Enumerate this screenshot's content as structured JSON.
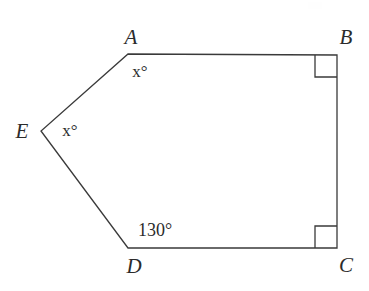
{
  "figure": {
    "type": "polygon-diagram",
    "shape_name": "pentagon ABCDE",
    "background_color": "#ffffff",
    "stroke_color": "#3a3a3a",
    "stroke_width": 1.3,
    "canvas": {
      "width": 369,
      "height": 291
    },
    "vertices": [
      {
        "id": "A",
        "label": "A",
        "x": 128,
        "y": 54,
        "label_x": 131,
        "label_y": 37
      },
      {
        "id": "B",
        "label": "B",
        "x": 337,
        "y": 55,
        "label_x": 346,
        "label_y": 37
      },
      {
        "id": "C",
        "label": "C",
        "x": 337,
        "y": 248,
        "label_x": 346,
        "label_y": 265
      },
      {
        "id": "D",
        "label": "D",
        "x": 128,
        "y": 248,
        "label_x": 134,
        "label_y": 266
      },
      {
        "id": "E",
        "label": "E",
        "x": 41,
        "y": 131,
        "label_x": 22,
        "label_y": 131
      }
    ],
    "edges": [
      {
        "from": "A",
        "to": "B"
      },
      {
        "from": "B",
        "to": "C"
      },
      {
        "from": "C",
        "to": "D"
      },
      {
        "from": "D",
        "to": "E"
      },
      {
        "from": "E",
        "to": "A"
      }
    ],
    "right_angle_markers": [
      {
        "at": "B",
        "size": 22,
        "dx": -1,
        "dy": 1
      },
      {
        "at": "C",
        "size": 22,
        "dx": -1,
        "dy": -1
      }
    ],
    "angle_labels": [
      {
        "at": "A",
        "variable": "x",
        "degree_symbol": "°",
        "text": "x°",
        "x": 140,
        "y": 71,
        "numeric": false
      },
      {
        "at": "E",
        "variable": "x",
        "degree_symbol": "°",
        "text": "x°",
        "x": 70,
        "y": 130,
        "numeric": false
      },
      {
        "at": "D",
        "value": "130",
        "degree_symbol": "°",
        "text": "130°",
        "x": 155,
        "y": 230,
        "numeric": true
      }
    ]
  }
}
